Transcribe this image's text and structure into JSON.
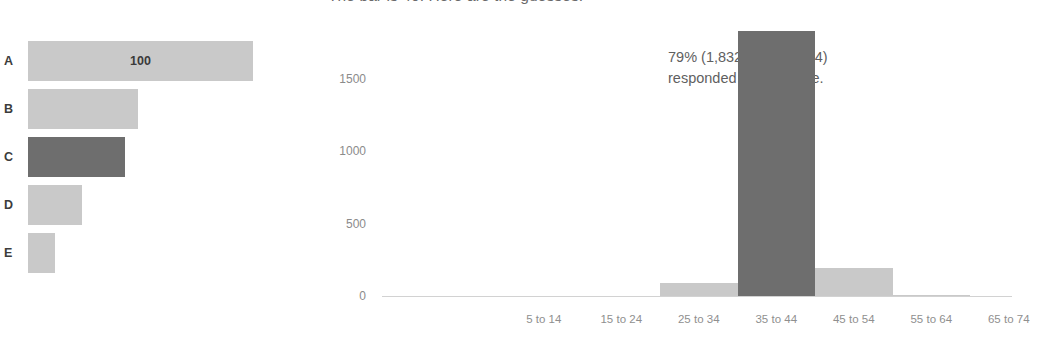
{
  "caption": "The bar is 40. Here are the guesses.",
  "left_chart": {
    "value_label": "100"
  },
  "histogram": {
    "annotation_line1": "79% (1,832 out of 2,354)",
    "annotation_line2": "responded in this range."
  },
  "colors": {
    "bar": "#c9c9c9",
    "bar_highlight": "#6e6e6e",
    "axis": "#d2d2d2",
    "tick_text": "#8b8b8b",
    "caption_text": "#6a6a6a"
  },
  "chart_data": [
    {
      "type": "bar",
      "orientation": "horizontal",
      "title": "",
      "xlabel": "",
      "ylabel": "",
      "categories": [
        "A",
        "B",
        "C",
        "D",
        "E"
      ],
      "values": [
        100,
        49,
        43,
        24,
        12
      ],
      "xlim": [
        0,
        100
      ],
      "grid": false,
      "legend": "none",
      "data_labels": [
        {
          "category": "A",
          "text": "100"
        }
      ],
      "highlighted": [
        "C"
      ]
    },
    {
      "type": "bar",
      "orientation": "vertical",
      "title": "",
      "xlabel": "",
      "ylabel": "",
      "categories": [
        "5 to 14",
        "15 to 24",
        "25 to 34",
        "35 to 44",
        "45 to 54",
        "55 to 64",
        "65 to 74",
        "75 to 84",
        "85 to 94"
      ],
      "values": [
        0,
        0,
        90,
        1832,
        195,
        4,
        0,
        0,
        0
      ],
      "ylim": [
        0,
        1900
      ],
      "yticks": [
        0,
        500,
        1000,
        1500
      ],
      "ytick_labels": [
        "0",
        "500",
        "1000",
        "1500"
      ],
      "grid": false,
      "legend": "none",
      "highlighted": [
        "35 to 44"
      ],
      "annotations": [
        {
          "text": "79% (1,832 out of 2,354) responded in this range.",
          "target_category": "35 to 44"
        }
      ]
    }
  ]
}
